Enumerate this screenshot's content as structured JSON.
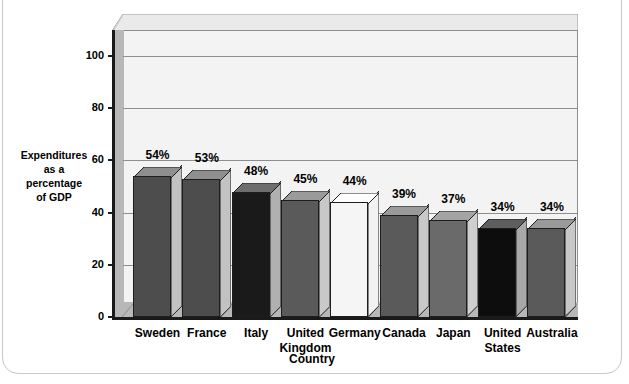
{
  "chart_data": {
    "type": "bar",
    "title": "",
    "subtitle": "",
    "xlabel": "Country",
    "ylabel": "Expenditures as a percentage of GDP",
    "ylabel_lines": [
      "Expenditures",
      "as a",
      "percentage",
      "of GDP"
    ],
    "categories": [
      "Sweden",
      "France",
      "Italy",
      "United Kingdom",
      "Germany",
      "Canada",
      "Japan",
      "United States",
      "Australia"
    ],
    "category_lines": [
      [
        "Sweden"
      ],
      [
        "France"
      ],
      [
        "Italy"
      ],
      [
        "United",
        "Kingdom"
      ],
      [
        "Germany"
      ],
      [
        "Canada"
      ],
      [
        "Japan"
      ],
      [
        "United",
        "States"
      ],
      [
        "Australia"
      ]
    ],
    "values": [
      54,
      53,
      48,
      45,
      44,
      39,
      37,
      34,
      34
    ],
    "data_labels": [
      "54%",
      "53%",
      "48%",
      "45%",
      "44%",
      "39%",
      "37%",
      "34%",
      "34%"
    ],
    "ylim": [
      0,
      110
    ],
    "yticks": [
      0,
      20,
      40,
      60,
      80,
      100
    ],
    "ytick_labels": [
      "0",
      "20",
      "40",
      "60",
      "80",
      "100"
    ],
    "grid": true,
    "grid_axis": "y",
    "legend": false,
    "legend_position": "none",
    "style": "3d-column",
    "bar_colors": [
      "#4d4d4d",
      "#4d4d4d",
      "#1a1a1a",
      "#5a5a5a",
      "#f5f5f5",
      "#5a5a5a",
      "#6a6a6a",
      "#0d0d0d",
      "#5a5a5a"
    ],
    "bar_top_colors": [
      "#8f8f8f",
      "#8f8f8f",
      "#6e6e6e",
      "#9a9a9a",
      "#ffffff",
      "#9a9a9a",
      "#a4a4a4",
      "#5e5e5e",
      "#9a9a9a"
    ],
    "bar_side_colors": [
      "#c2c2c2",
      "#c2c2c2",
      "#b0b0b0",
      "#c8c8c8",
      "#f2f2f2",
      "#c8c8c8",
      "#cfcfcf",
      "#a8a8a8",
      "#c8c8c8"
    ]
  },
  "colors": {
    "plot_background": "#f3f3f3",
    "wall_shade": "#b8b8b8",
    "axis": "#1a1a1a",
    "gridline": "#8d8d8d",
    "frame_border": "#c9c9c9",
    "page_background": "#ffffff",
    "text": "#000000"
  }
}
